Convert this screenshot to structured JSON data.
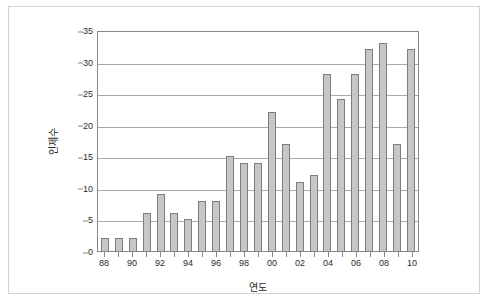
{
  "chart_data": {
    "type": "bar",
    "title": "",
    "xlabel": "연도",
    "ylabel": "인제수",
    "ylim": [
      0,
      35
    ],
    "yticks": [
      0,
      5,
      10,
      15,
      20,
      25,
      30,
      35
    ],
    "grid": true,
    "legend": "none",
    "categories": [
      "88",
      "89",
      "90",
      "91",
      "92",
      "93",
      "94",
      "95",
      "96",
      "97",
      "98",
      "99",
      "00",
      "01",
      "02",
      "03",
      "04",
      "05",
      "06",
      "07",
      "08",
      "09",
      "10"
    ],
    "tick_labels_visible": [
      "88",
      "",
      "90",
      "",
      "92",
      "",
      "94",
      "",
      "96",
      "",
      "98",
      "",
      "00",
      "",
      "02",
      "",
      "04",
      "",
      "06",
      "",
      "08",
      "",
      "10"
    ],
    "values": [
      2,
      2,
      2,
      6,
      9,
      6,
      5,
      8,
      8,
      15,
      14,
      14,
      22,
      17,
      11,
      12,
      28,
      24,
      28,
      32,
      33,
      17,
      32
    ],
    "series": [
      {
        "name": "인제수",
        "values": [
          2,
          2,
          2,
          6,
          9,
          6,
          5,
          8,
          8,
          15,
          14,
          14,
          22,
          17,
          11,
          12,
          28,
          24,
          28,
          32,
          33,
          17,
          32
        ]
      }
    ],
    "colors": {
      "bar_fill": "#c6c6c6",
      "bar_border": "#7d7d7d",
      "gridline": "#a8a8a8",
      "axis": "#868686",
      "frame": "#d4d4d4",
      "text": "#1f1f1f"
    }
  }
}
